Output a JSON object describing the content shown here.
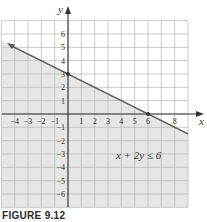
{
  "caption": "FIGURE 9.12",
  "colors": {
    "shade": "#e6e6e6",
    "grid": "#bdbdbd",
    "axis": "#333333",
    "line": "#555555",
    "background": "#ffffff"
  },
  "chart_data": {
    "type": "area",
    "title": "",
    "xlabel": "x",
    "ylabel": "y",
    "xlim": [
      -5,
      9
    ],
    "ylim": [
      -7,
      7
    ],
    "grid": true,
    "x_tick_labels": [
      "-4",
      "-3",
      "-2",
      "-1",
      "1",
      "2",
      "3",
      "4",
      "5",
      "6",
      "8"
    ],
    "y_tick_labels": [
      "6",
      "5",
      "4",
      "3",
      "2",
      "1",
      "-1",
      "-2",
      "-3",
      "-4",
      "-5",
      "-6"
    ],
    "boundary_line": {
      "equation": "x + 2y = 6",
      "points": [
        [
          -4.5,
          5.25
        ],
        [
          0,
          3
        ],
        [
          6,
          0
        ],
        [
          9,
          -1.5
        ]
      ],
      "marked_points": [
        [
          0,
          3
        ],
        [
          6,
          0
        ]
      ],
      "style": "solid"
    },
    "shaded_region": "below line (x + 2y <= 6)",
    "annotation": {
      "text": "x + 2y ≤ 6",
      "position": [
        6,
        -3.5
      ]
    }
  }
}
